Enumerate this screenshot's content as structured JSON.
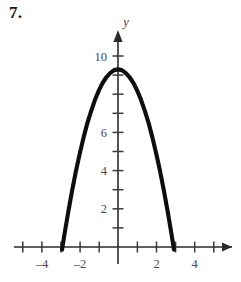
{
  "problem": {
    "number_label": "7."
  },
  "chart_data": {
    "type": "line",
    "title": "",
    "subtitle": "",
    "xlabel": "",
    "ylabel": "y",
    "axis_labels": {
      "x_axis_name": "",
      "y_axis_name": "y"
    },
    "equation_approx": "y = 9.3 - 1.1x^2",
    "xlim": [
      -4.9,
      5.2
    ],
    "ylim": [
      -0.9,
      10.6
    ],
    "grid": false,
    "legend": false,
    "legend_position": "none",
    "x_tick_values": [
      -4,
      -3,
      -2,
      -1,
      1,
      2,
      3,
      4,
      5
    ],
    "y_tick_values": [
      1,
      2,
      3,
      4,
      5,
      6,
      7,
      8,
      9,
      10
    ],
    "x_tick_labels": [
      {
        "value": -4,
        "text": "–4"
      },
      {
        "value": -2,
        "text": "–2"
      },
      {
        "value": 2,
        "text": "2"
      },
      {
        "value": 4,
        "text": "4"
      }
    ],
    "y_tick_labels": [
      {
        "value": 2,
        "text": "2"
      },
      {
        "value": 4,
        "text": "4"
      },
      {
        "value": 6,
        "text": "6"
      },
      {
        "value": 10,
        "text": "10"
      }
    ],
    "vertex": {
      "x": 0,
      "y": 9.3
    },
    "x_intercepts": [
      -2.9,
      2.9
    ],
    "series": [
      {
        "name": "parabola",
        "color": "#0d0d0d",
        "x": [
          -2.93,
          -2.8,
          -2.6,
          -2.4,
          -2.2,
          -2.0,
          -1.8,
          -1.6,
          -1.4,
          -1.2,
          -1.0,
          -0.8,
          -0.6,
          -0.4,
          -0.2,
          0.0,
          0.2,
          0.4,
          0.6,
          0.8,
          1.0,
          1.2,
          1.4,
          1.6,
          1.8,
          2.0,
          2.2,
          2.4,
          2.6,
          2.8,
          2.93
        ],
        "y": [
          -0.14,
          0.68,
          1.86,
          2.96,
          3.98,
          4.9,
          5.74,
          6.5,
          7.14,
          7.72,
          8.2,
          8.6,
          8.9,
          9.12,
          9.26,
          9.3,
          9.26,
          9.12,
          8.9,
          8.6,
          8.2,
          7.72,
          7.14,
          6.5,
          5.74,
          4.9,
          3.98,
          2.96,
          1.86,
          0.68,
          -0.14
        ]
      }
    ],
    "colors": {
      "curve": "#0d0d0d",
      "axis": "#2a2a2a",
      "tick_label": "#4a4a4a",
      "background": "#ffffff"
    }
  }
}
